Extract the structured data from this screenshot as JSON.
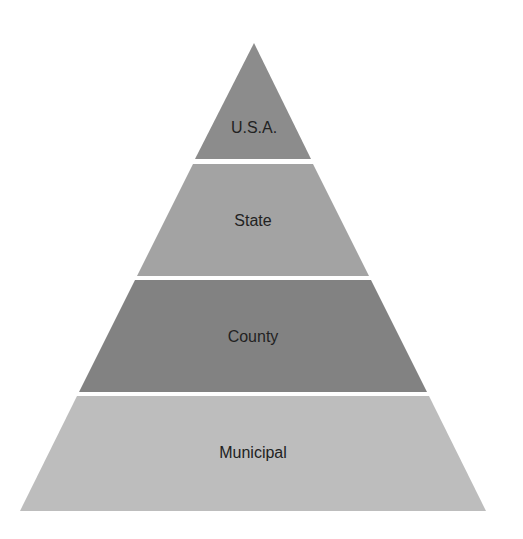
{
  "diagram": {
    "type": "pyramid",
    "background": "#ffffff",
    "tiers": [
      {
        "label": "U.S.A.",
        "color": "#8c8c8c",
        "points": "254,43 311,159 195,159",
        "label_x": 254,
        "label_y": 133
      },
      {
        "label": "State",
        "color": "#a3a3a3",
        "points": "193,164 313,164 369,276 137,276",
        "label_x": 253,
        "label_y": 226
      },
      {
        "label": "County",
        "color": "#828282",
        "points": "135,280 371,280 427,392 79,392",
        "label_x": 253,
        "label_y": 342
      },
      {
        "label": "Municipal",
        "color": "#bdbdbd",
        "points": "77,396 429,396 486,511 20,511",
        "label_x": 253,
        "label_y": 458
      }
    ]
  }
}
